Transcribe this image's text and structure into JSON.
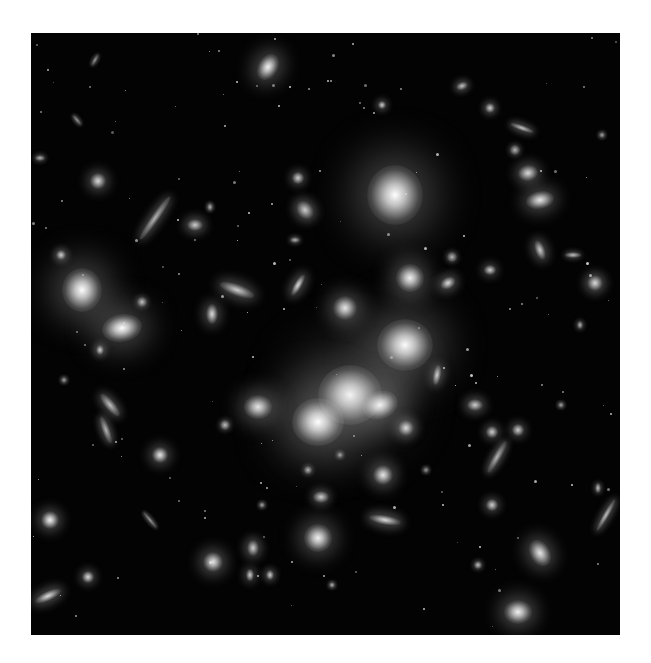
{
  "image": {
    "description": "Deep-field photograph of a galaxy cluster with bright elliptical galaxies and gravitationally lensed arcs on a black background",
    "frame": {
      "x": 31,
      "y": 33,
      "width": 589,
      "height": 602,
      "background": "#030303"
    },
    "page_background": "#ffffff"
  },
  "galaxies": [
    {
      "x": 395,
      "y": 195,
      "rx": 28,
      "ry": 30,
      "rot": 0,
      "b": 1.0,
      "halo": 46
    },
    {
      "x": 405,
      "y": 345,
      "rx": 28,
      "ry": 26,
      "rot": 0,
      "b": 1.0,
      "halo": 44
    },
    {
      "x": 350,
      "y": 395,
      "rx": 32,
      "ry": 30,
      "rot": 0,
      "b": 1.0,
      "halo": 60
    },
    {
      "x": 318,
      "y": 422,
      "rx": 26,
      "ry": 24,
      "rot": 0,
      "b": 1.0,
      "halo": 48
    },
    {
      "x": 380,
      "y": 405,
      "rx": 18,
      "ry": 14,
      "rot": -20,
      "b": 0.95,
      "halo": 30
    },
    {
      "x": 82,
      "y": 290,
      "rx": 20,
      "ry": 22,
      "rot": 0,
      "b": 1.0,
      "halo": 34
    },
    {
      "x": 122,
      "y": 328,
      "rx": 20,
      "ry": 14,
      "rot": -10,
      "b": 1.0,
      "halo": 30
    },
    {
      "x": 268,
      "y": 67,
      "rx": 10,
      "ry": 14,
      "rot": 30,
      "b": 0.95,
      "halo": 18
    },
    {
      "x": 410,
      "y": 278,
      "rx": 14,
      "ry": 14,
      "rot": 0,
      "b": 0.95,
      "halo": 20
    },
    {
      "x": 345,
      "y": 308,
      "rx": 12,
      "ry": 12,
      "rot": 0,
      "b": 0.9,
      "halo": 18
    },
    {
      "x": 258,
      "y": 407,
      "rx": 14,
      "ry": 12,
      "rot": 0,
      "b": 0.9,
      "halo": 20
    },
    {
      "x": 318,
      "y": 538,
      "rx": 14,
      "ry": 14,
      "rot": 0,
      "b": 0.95,
      "halo": 20
    },
    {
      "x": 540,
      "y": 200,
      "rx": 14,
      "ry": 9,
      "rot": -10,
      "b": 0.9,
      "halo": 16
    },
    {
      "x": 528,
      "y": 173,
      "rx": 10,
      "ry": 8,
      "rot": -10,
      "b": 0.85,
      "halo": 12
    },
    {
      "x": 540,
      "y": 553,
      "rx": 10,
      "ry": 14,
      "rot": -30,
      "b": 0.9,
      "halo": 16
    },
    {
      "x": 518,
      "y": 612,
      "rx": 14,
      "ry": 12,
      "rot": 0,
      "b": 0.95,
      "halo": 18
    },
    {
      "x": 50,
      "y": 520,
      "rx": 9,
      "ry": 9,
      "rot": 0,
      "b": 0.95,
      "halo": 12
    },
    {
      "x": 213,
      "y": 562,
      "rx": 10,
      "ry": 10,
      "rot": 0,
      "b": 0.9,
      "halo": 14
    },
    {
      "x": 160,
      "y": 455,
      "rx": 8,
      "ry": 8,
      "rot": 0,
      "b": 0.9,
      "halo": 12
    },
    {
      "x": 98,
      "y": 181,
      "rx": 8,
      "ry": 8,
      "rot": 0,
      "b": 0.85,
      "halo": 12
    },
    {
      "x": 195,
      "y": 225,
      "rx": 8,
      "ry": 6,
      "rot": 0,
      "b": 0.8,
      "halo": 10
    },
    {
      "x": 212,
      "y": 314,
      "rx": 6,
      "ry": 10,
      "rot": 0,
      "b": 0.85,
      "halo": 12
    },
    {
      "x": 237,
      "y": 290,
      "rx": 18,
      "ry": 6,
      "rot": 20,
      "b": 0.8,
      "halo": 12
    },
    {
      "x": 298,
      "y": 285,
      "rx": 4,
      "ry": 12,
      "rot": 30,
      "b": 0.85,
      "halo": 10
    },
    {
      "x": 305,
      "y": 210,
      "rx": 8,
      "ry": 10,
      "rot": -40,
      "b": 0.8,
      "halo": 10
    },
    {
      "x": 298,
      "y": 178,
      "rx": 6,
      "ry": 6,
      "rot": 0,
      "b": 0.8,
      "halo": 8
    },
    {
      "x": 490,
      "y": 270,
      "rx": 6,
      "ry": 5,
      "rot": 0,
      "b": 0.8,
      "halo": 8
    },
    {
      "x": 448,
      "y": 283,
      "rx": 8,
      "ry": 6,
      "rot": -30,
      "b": 0.85,
      "halo": 10
    },
    {
      "x": 540,
      "y": 250,
      "rx": 5,
      "ry": 10,
      "rot": -20,
      "b": 0.8,
      "halo": 10
    },
    {
      "x": 595,
      "y": 283,
      "rx": 8,
      "ry": 8,
      "rot": 0,
      "b": 0.85,
      "halo": 10
    },
    {
      "x": 475,
      "y": 405,
      "rx": 8,
      "ry": 6,
      "rot": 0,
      "b": 0.8,
      "halo": 10
    },
    {
      "x": 492,
      "y": 432,
      "rx": 6,
      "ry": 6,
      "rot": 0,
      "b": 0.8,
      "halo": 8
    },
    {
      "x": 518,
      "y": 430,
      "rx": 6,
      "ry": 6,
      "rot": 0,
      "b": 0.8,
      "halo": 8
    },
    {
      "x": 385,
      "y": 520,
      "rx": 16,
      "ry": 5,
      "rot": 10,
      "b": 0.85,
      "halo": 10
    },
    {
      "x": 383,
      "y": 475,
      "rx": 10,
      "ry": 10,
      "rot": 0,
      "b": 0.9,
      "halo": 14
    },
    {
      "x": 321,
      "y": 497,
      "rx": 8,
      "ry": 6,
      "rot": 0,
      "b": 0.8,
      "halo": 8
    },
    {
      "x": 253,
      "y": 548,
      "rx": 6,
      "ry": 8,
      "rot": 0,
      "b": 0.8,
      "halo": 10
    },
    {
      "x": 250,
      "y": 575,
      "rx": 4,
      "ry": 6,
      "rot": 0,
      "b": 0.8,
      "halo": 8
    },
    {
      "x": 88,
      "y": 577,
      "rx": 6,
      "ry": 6,
      "rot": 0,
      "b": 0.85,
      "halo": 8
    },
    {
      "x": 48,
      "y": 596,
      "rx": 14,
      "ry": 5,
      "rot": -25,
      "b": 0.85,
      "halo": 10
    },
    {
      "x": 492,
      "y": 505,
      "rx": 6,
      "ry": 6,
      "rot": 0,
      "b": 0.8,
      "halo": 8
    },
    {
      "x": 406,
      "y": 428,
      "rx": 8,
      "ry": 8,
      "rot": 0,
      "b": 0.85,
      "halo": 10
    },
    {
      "x": 437,
      "y": 375,
      "rx": 4,
      "ry": 10,
      "rot": 10,
      "b": 0.8,
      "halo": 8
    },
    {
      "x": 270,
      "y": 575,
      "rx": 4,
      "ry": 5,
      "rot": 0,
      "b": 0.8,
      "halo": 6
    },
    {
      "x": 382,
      "y": 105,
      "rx": 4,
      "ry": 4,
      "rot": 0,
      "b": 0.8,
      "halo": 6
    },
    {
      "x": 462,
      "y": 86,
      "rx": 6,
      "ry": 4,
      "rot": -20,
      "b": 0.75,
      "halo": 6
    },
    {
      "x": 490,
      "y": 108,
      "rx": 5,
      "ry": 5,
      "rot": 0,
      "b": 0.8,
      "halo": 6
    },
    {
      "x": 522,
      "y": 128,
      "rx": 12,
      "ry": 3,
      "rot": 20,
      "b": 0.75,
      "halo": 6
    },
    {
      "x": 61,
      "y": 255,
      "rx": 5,
      "ry": 5,
      "rot": 0,
      "b": 0.8,
      "halo": 6
    },
    {
      "x": 100,
      "y": 350,
      "rx": 4,
      "ry": 5,
      "rot": 0,
      "b": 0.8,
      "halo": 6
    },
    {
      "x": 573,
      "y": 255,
      "rx": 8,
      "ry": 3,
      "rot": 0,
      "b": 0.75,
      "halo": 5
    },
    {
      "x": 580,
      "y": 325,
      "rx": 3,
      "ry": 4,
      "rot": 0,
      "b": 0.7,
      "halo": 4
    },
    {
      "x": 598,
      "y": 488,
      "rx": 3,
      "ry": 5,
      "rot": 0,
      "b": 0.75,
      "halo": 4
    },
    {
      "x": 606,
      "y": 515,
      "rx": 3,
      "ry": 18,
      "rot": 30,
      "b": 0.75,
      "halo": 6
    },
    {
      "x": 478,
      "y": 565,
      "rx": 4,
      "ry": 4,
      "rot": 0,
      "b": 0.75,
      "halo": 4
    },
    {
      "x": 225,
      "y": 425,
      "rx": 5,
      "ry": 5,
      "rot": 0,
      "b": 0.75,
      "halo": 5
    },
    {
      "x": 155,
      "y": 218,
      "rx": 4,
      "ry": 26,
      "rot": 35,
      "b": 0.7,
      "halo": 8
    },
    {
      "x": 110,
      "y": 405,
      "rx": 5,
      "ry": 14,
      "rot": -40,
      "b": 0.75,
      "halo": 8
    },
    {
      "x": 106,
      "y": 430,
      "rx": 4,
      "ry": 14,
      "rot": -20,
      "b": 0.7,
      "halo": 6
    },
    {
      "x": 497,
      "y": 457,
      "rx": 4,
      "ry": 18,
      "rot": 30,
      "b": 0.7,
      "halo": 6
    },
    {
      "x": 150,
      "y": 520,
      "rx": 2,
      "ry": 10,
      "rot": -40,
      "b": 0.6,
      "halo": 3
    },
    {
      "x": 77,
      "y": 120,
      "rx": 2,
      "ry": 6,
      "rot": -40,
      "b": 0.6,
      "halo": 3
    },
    {
      "x": 95,
      "y": 60,
      "rx": 2,
      "ry": 6,
      "rot": 30,
      "b": 0.6,
      "halo": 3
    },
    {
      "x": 40,
      "y": 158,
      "rx": 5,
      "ry": 3,
      "rot": 0,
      "b": 0.7,
      "halo": 4
    },
    {
      "x": 308,
      "y": 470,
      "rx": 4,
      "ry": 4,
      "rot": 0,
      "b": 0.7,
      "halo": 4
    },
    {
      "x": 332,
      "y": 585,
      "rx": 3,
      "ry": 3,
      "rot": 0,
      "b": 0.7,
      "halo": 3
    },
    {
      "x": 452,
      "y": 257,
      "rx": 5,
      "ry": 5,
      "rot": 0,
      "b": 0.7,
      "halo": 5
    },
    {
      "x": 515,
      "y": 150,
      "rx": 5,
      "ry": 5,
      "rot": 0,
      "b": 0.7,
      "halo": 5
    },
    {
      "x": 602,
      "y": 135,
      "rx": 3,
      "ry": 3,
      "rot": 0,
      "b": 0.65,
      "halo": 3
    },
    {
      "x": 210,
      "y": 207,
      "rx": 3,
      "ry": 4,
      "rot": 0,
      "b": 0.7,
      "halo": 3
    },
    {
      "x": 295,
      "y": 240,
      "rx": 5,
      "ry": 3,
      "rot": 0,
      "b": 0.7,
      "halo": 4
    },
    {
      "x": 142,
      "y": 302,
      "rx": 5,
      "ry": 5,
      "rot": 0,
      "b": 0.75,
      "halo": 5
    },
    {
      "x": 64,
      "y": 380,
      "rx": 3,
      "ry": 3,
      "rot": 0,
      "b": 0.65,
      "halo": 3
    },
    {
      "x": 262,
      "y": 505,
      "rx": 3,
      "ry": 3,
      "rot": 0,
      "b": 0.65,
      "halo": 3
    },
    {
      "x": 340,
      "y": 455,
      "rx": 3,
      "ry": 3,
      "rot": 0,
      "b": 0.65,
      "halo": 3
    },
    {
      "x": 561,
      "y": 405,
      "rx": 3,
      "ry": 3,
      "rot": 0,
      "b": 0.65,
      "halo": 3
    },
    {
      "x": 426,
      "y": 470,
      "rx": 3,
      "ry": 3,
      "rot": 0,
      "b": 0.6,
      "halo": 3
    }
  ]
}
